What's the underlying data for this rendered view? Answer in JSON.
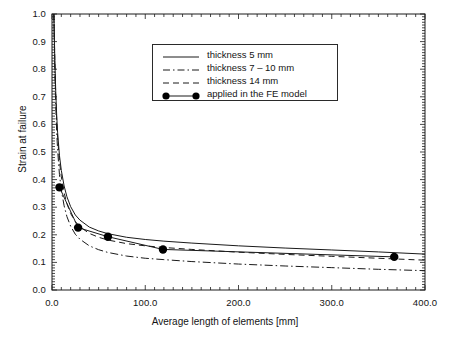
{
  "chart_data": {
    "type": "line",
    "title": "",
    "xlabel": "Average length of elements [mm]",
    "ylabel": "Strain at failure",
    "xlim": [
      0.0,
      400.0
    ],
    "ylim": [
      0.0,
      1.0
    ],
    "xticks": [
      "0.0",
      "100.0",
      "200.0",
      "300.0",
      "400.0"
    ],
    "xtick_values": [
      0.0,
      100.0,
      200.0,
      300.0,
      400.0
    ],
    "yticks": [
      "0.0",
      "0.1",
      "0.2",
      "0.3",
      "0.4",
      "0.5",
      "0.6",
      "0.7",
      "0.8",
      "0.9",
      "1.0"
    ],
    "ytick_values": [
      0.0,
      0.1,
      0.2,
      0.3,
      0.4,
      0.5,
      0.6,
      0.7,
      0.8,
      0.9,
      1.0
    ],
    "grid": false,
    "legend_position": "upper-center",
    "series": [
      {
        "name": "thickness 5 mm",
        "style": "solid",
        "color": "#1a1a1a",
        "x": [
          2.0,
          3.0,
          4.0,
          5.0,
          6.0,
          8.0,
          10.0,
          13.0,
          16.0,
          20.0,
          25.0,
          30.0,
          40.0,
          50.0,
          60.0,
          80.0,
          100.0,
          120.0,
          150.0,
          200.0,
          250.0,
          300.0,
          350.0,
          400.0
        ],
        "y": [
          1.0,
          0.84,
          0.72,
          0.635,
          0.572,
          0.487,
          0.433,
          0.377,
          0.338,
          0.302,
          0.272,
          0.253,
          0.228,
          0.214,
          0.204,
          0.191,
          0.183,
          0.177,
          0.17,
          0.16,
          0.152,
          0.145,
          0.138,
          0.13
        ]
      },
      {
        "name": "thickness 7 – 10 mm",
        "style": "dashdot",
        "color": "#1a1a1a",
        "x": [
          2.0,
          3.0,
          4.0,
          5.0,
          6.0,
          8.0,
          10.0,
          13.0,
          16.0,
          20.0,
          25.0,
          30.0,
          40.0,
          50.0,
          60.0,
          80.0,
          100.0,
          120.0,
          150.0,
          200.0,
          250.0,
          300.0,
          350.0,
          400.0
        ],
        "y": [
          1.0,
          0.8,
          0.665,
          0.575,
          0.508,
          0.418,
          0.362,
          0.305,
          0.266,
          0.231,
          0.202,
          0.184,
          0.16,
          0.146,
          0.136,
          0.123,
          0.115,
          0.11,
          0.103,
          0.094,
          0.087,
          0.081,
          0.075,
          0.07
        ]
      },
      {
        "name": "thickness 14 mm",
        "style": "dashed",
        "color": "#1a1a1a",
        "x": [
          2.0,
          3.0,
          4.0,
          5.0,
          6.0,
          8.0,
          10.0,
          13.0,
          16.0,
          20.0,
          25.0,
          30.0,
          40.0,
          50.0,
          60.0,
          80.0,
          100.0,
          120.0,
          150.0,
          200.0,
          250.0,
          300.0,
          350.0,
          400.0
        ],
        "y": [
          1.0,
          0.83,
          0.705,
          0.618,
          0.553,
          0.466,
          0.41,
          0.352,
          0.313,
          0.277,
          0.248,
          0.229,
          0.205,
          0.191,
          0.181,
          0.168,
          0.16,
          0.154,
          0.147,
          0.137,
          0.129,
          0.122,
          0.115,
          0.108
        ]
      },
      {
        "name": "applied in the FE model",
        "style": "markers",
        "color": "#000000",
        "x": [
          8.0,
          28.0,
          60.0,
          119.0,
          367.0
        ],
        "y": [
          0.372,
          0.226,
          0.193,
          0.147,
          0.12
        ]
      }
    ]
  },
  "legend": {
    "items": [
      {
        "label": "thickness 5 mm",
        "style": "solid"
      },
      {
        "label": "thickness 7 – 10 mm",
        "style": "dashdot"
      },
      {
        "label": "thickness 14 mm",
        "style": "dashed"
      },
      {
        "label": "applied in the FE model",
        "style": "markers"
      }
    ]
  }
}
